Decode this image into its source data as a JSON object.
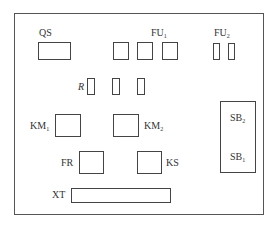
{
  "diagram": {
    "type": "equipment-layout",
    "components": [
      {
        "id": "QS",
        "label": "QS",
        "sub": ""
      },
      {
        "id": "FU1",
        "label": "FU",
        "sub": "1"
      },
      {
        "id": "FU2",
        "label": "FU",
        "sub": "2"
      },
      {
        "id": "R",
        "label": "R",
        "sub": ""
      },
      {
        "id": "KM1",
        "label": "KM",
        "sub": "1"
      },
      {
        "id": "KM2",
        "label": "KM",
        "sub": "2"
      },
      {
        "id": "SB2",
        "label": "SB",
        "sub": "2"
      },
      {
        "id": "SB1",
        "label": "SB",
        "sub": "1"
      },
      {
        "id": "FR",
        "label": "FR",
        "sub": ""
      },
      {
        "id": "KS",
        "label": "KS",
        "sub": ""
      },
      {
        "id": "XT",
        "label": "XT",
        "sub": ""
      }
    ]
  }
}
